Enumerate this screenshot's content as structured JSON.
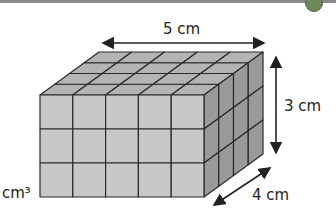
{
  "figure": {
    "type": "cuboid-of-unit-cubes",
    "dimensions": {
      "length": 5,
      "height": 3,
      "depth": 4
    },
    "labels": {
      "length": "5 cm",
      "height": "3 cm",
      "depth": "4 cm",
      "unit_partial": "cm³"
    },
    "colors": {
      "front": "#c8c8c8",
      "top": "#b4b4b4",
      "side": "#9a9a9a",
      "edge": "#2a2a2a"
    }
  },
  "header": {
    "icon": "badge-icon"
  }
}
